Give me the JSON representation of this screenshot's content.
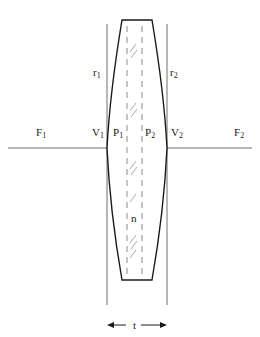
{
  "figure": {
    "kind": "thick-lens-cardinal-points-diagram",
    "colors": {
      "lens_outline": "#1a1a1a",
      "axis_line": "#666666",
      "construction_line": "#777777",
      "dashed_line": "#888888",
      "hatch": "#999999",
      "background": "#ffffff",
      "text": "#1a1a1a"
    },
    "labels": [
      {
        "name": "focal-point-left",
        "text": "F",
        "sub": "1",
        "x": 36,
        "y": 127
      },
      {
        "name": "vertex-left",
        "text": "V",
        "sub": "1",
        "x": 92,
        "y": 127
      },
      {
        "name": "principal-point-left",
        "text": "P",
        "sub": "1",
        "x": 113,
        "y": 127
      },
      {
        "name": "principal-point-right",
        "text": "P",
        "sub": "2",
        "x": 145,
        "y": 127
      },
      {
        "name": "vertex-right",
        "text": "V",
        "sub": "2",
        "x": 171,
        "y": 127
      },
      {
        "name": "focal-point-right",
        "text": "F",
        "sub": "2",
        "x": 234,
        "y": 127
      },
      {
        "name": "radius-left",
        "text": "r",
        "sub": "1",
        "x": 93,
        "y": 67
      },
      {
        "name": "radius-right",
        "text": "r",
        "sub": "2",
        "x": 170,
        "y": 67
      },
      {
        "name": "refractive-index",
        "text": "n",
        "sub": "",
        "x": 131,
        "y": 213
      },
      {
        "name": "thickness",
        "text": "t",
        "sub": "",
        "x": 133,
        "y": 320
      }
    ],
    "geometry": {
      "axis": {
        "y": 148,
        "x_start": 8,
        "x_end": 252
      },
      "lens": {
        "top_y": 20,
        "bottom_y": 280,
        "top_left_x": 122,
        "top_right_x": 152,
        "bottom_left_x": 122,
        "bottom_right_x": 152,
        "vertex_left_x": 107,
        "vertex_right_x": 167,
        "mid_y": 148
      },
      "vertical_construction_lines": [
        {
          "name": "vertex-left-line",
          "x": 107,
          "y_top": 24,
          "y_bottom": 305
        },
        {
          "name": "vertex-right-line",
          "x": 167,
          "y_top": 24,
          "y_bottom": 305
        }
      ],
      "dashed_principal_planes": [
        {
          "name": "principal-plane-left",
          "x": 127,
          "y_top": 26,
          "y_bottom": 276
        },
        {
          "name": "principal-plane-right",
          "x": 142,
          "y_top": 26,
          "y_bottom": 276
        }
      ],
      "hatch_groups_y": [
        46,
        105,
        163,
        196,
        237,
        252
      ],
      "thickness_dimension": {
        "y": 325,
        "x_left": 107,
        "x_right": 167
      }
    }
  }
}
